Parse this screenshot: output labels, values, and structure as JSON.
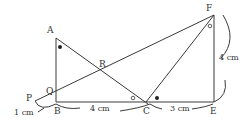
{
  "diagram": {
    "type": "geometry-construction",
    "colors": {
      "stroke": "#3a3a3a",
      "text": "#333333",
      "background": "#ffffff"
    },
    "points": {
      "A": {
        "label": "A",
        "x": 56,
        "y": 38
      },
      "B": {
        "label": "B",
        "x": 56,
        "y": 102
      },
      "C": {
        "label": "C",
        "x": 146,
        "y": 102
      },
      "E": {
        "label": "E",
        "x": 214,
        "y": 102
      },
      "F": {
        "label": "F",
        "x": 214,
        "y": 15
      },
      "P": {
        "label": "P",
        "x": 35,
        "y": 101
      },
      "Q": {
        "label": "Q",
        "x": 56,
        "y": 91
      },
      "R": {
        "label": "R",
        "x": 101,
        "y": 70
      }
    },
    "measures": {
      "BC": "4 cm",
      "CE": "3 cm",
      "EF": "4 cm",
      "PB": "1 cm"
    },
    "marks": {
      "angle_A": "filled-dot",
      "angle_FCE": "filled-dot",
      "angle_ACB": "open-circle",
      "angle_CFE": "open-circle"
    }
  }
}
